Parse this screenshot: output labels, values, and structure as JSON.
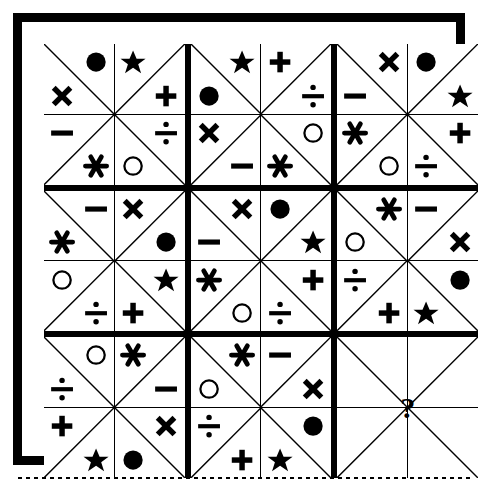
{
  "puzzle": {
    "title": "Symbol Matrix Logic Puzzle",
    "grid_size": "3x3 blocks",
    "block_size": "2x2 cells",
    "question_marker": "?",
    "colors": {
      "ink": "#000000",
      "paper": "#ffffff"
    },
    "symbol_legend": [
      {
        "key": "filled-circle",
        "name": "filled-circle-icon",
        "glyph": "●"
      },
      {
        "key": "open-circle",
        "name": "open-circle-icon",
        "glyph": "○"
      },
      {
        "key": "star",
        "name": "star-icon",
        "glyph": "★"
      },
      {
        "key": "cross",
        "name": "cross-icon",
        "glyph": "✕"
      },
      {
        "key": "plus",
        "name": "plus-icon",
        "glyph": "＋"
      },
      {
        "key": "minus",
        "name": "minus-icon",
        "glyph": "−"
      },
      {
        "key": "divide",
        "name": "divide-icon",
        "glyph": "÷"
      },
      {
        "key": "asterisk",
        "name": "asterisk-icon",
        "glyph": "✱"
      }
    ],
    "blocks": [
      {
        "index": 0,
        "position": "top-left",
        "is_question": false,
        "cells": [
          {
            "diagonal": "tl-br",
            "symbols": [
              {
                "slot": "ur",
                "key": "filled-circle"
              },
              {
                "slot": "ll",
                "key": "cross"
              }
            ]
          },
          {
            "diagonal": "tr-bl",
            "symbols": [
              {
                "slot": "ul",
                "key": "star"
              },
              {
                "slot": "lr",
                "key": "plus"
              }
            ]
          },
          {
            "diagonal": "tr-bl",
            "symbols": [
              {
                "slot": "ul",
                "key": "minus"
              },
              {
                "slot": "lr",
                "key": "asterisk"
              }
            ]
          },
          {
            "diagonal": "tl-br",
            "symbols": [
              {
                "slot": "ur",
                "key": "divide"
              },
              {
                "slot": "ll",
                "key": "open-circle"
              }
            ]
          }
        ]
      },
      {
        "index": 1,
        "position": "top-center",
        "is_question": false,
        "cells": [
          {
            "diagonal": "tl-br",
            "symbols": [
              {
                "slot": "ur",
                "key": "star"
              },
              {
                "slot": "ll",
                "key": "filled-circle"
              }
            ]
          },
          {
            "diagonal": "tr-bl",
            "symbols": [
              {
                "slot": "ul",
                "key": "plus"
              },
              {
                "slot": "lr",
                "key": "divide"
              }
            ]
          },
          {
            "diagonal": "tr-bl",
            "symbols": [
              {
                "slot": "ul",
                "key": "cross"
              },
              {
                "slot": "lr",
                "key": "minus"
              }
            ]
          },
          {
            "diagonal": "tl-br",
            "symbols": [
              {
                "slot": "ur",
                "key": "open-circle"
              },
              {
                "slot": "ll",
                "key": "asterisk"
              }
            ]
          }
        ]
      },
      {
        "index": 2,
        "position": "top-right",
        "is_question": false,
        "cells": [
          {
            "diagonal": "tl-br",
            "symbols": [
              {
                "slot": "ur",
                "key": "cross"
              },
              {
                "slot": "ll",
                "key": "minus"
              }
            ]
          },
          {
            "diagonal": "tr-bl",
            "symbols": [
              {
                "slot": "ul",
                "key": "filled-circle"
              },
              {
                "slot": "lr",
                "key": "star"
              }
            ]
          },
          {
            "diagonal": "tr-bl",
            "symbols": [
              {
                "slot": "ul",
                "key": "asterisk"
              },
              {
                "slot": "lr",
                "key": "open-circle"
              }
            ]
          },
          {
            "diagonal": "tl-br",
            "symbols": [
              {
                "slot": "ur",
                "key": "plus"
              },
              {
                "slot": "ll",
                "key": "divide"
              }
            ]
          }
        ]
      },
      {
        "index": 3,
        "position": "middle-left",
        "is_question": false,
        "cells": [
          {
            "diagonal": "tl-br",
            "symbols": [
              {
                "slot": "ur",
                "key": "minus"
              },
              {
                "slot": "ll",
                "key": "asterisk"
              }
            ]
          },
          {
            "diagonal": "tr-bl",
            "symbols": [
              {
                "slot": "ul",
                "key": "cross"
              },
              {
                "slot": "lr",
                "key": "filled-circle"
              }
            ]
          },
          {
            "diagonal": "tr-bl",
            "symbols": [
              {
                "slot": "ul",
                "key": "open-circle"
              },
              {
                "slot": "lr",
                "key": "divide"
              }
            ]
          },
          {
            "diagonal": "tl-br",
            "symbols": [
              {
                "slot": "ur",
                "key": "star"
              },
              {
                "slot": "ll",
                "key": "plus"
              }
            ]
          }
        ]
      },
      {
        "index": 4,
        "position": "middle-center",
        "is_question": false,
        "cells": [
          {
            "diagonal": "tl-br",
            "symbols": [
              {
                "slot": "ur",
                "key": "cross"
              },
              {
                "slot": "ll",
                "key": "minus"
              }
            ]
          },
          {
            "diagonal": "tr-bl",
            "symbols": [
              {
                "slot": "ul",
                "key": "filled-circle"
              },
              {
                "slot": "lr",
                "key": "star"
              }
            ]
          },
          {
            "diagonal": "tr-bl",
            "symbols": [
              {
                "slot": "ul",
                "key": "asterisk"
              },
              {
                "slot": "lr",
                "key": "open-circle"
              }
            ]
          },
          {
            "diagonal": "tl-br",
            "symbols": [
              {
                "slot": "ur",
                "key": "plus"
              },
              {
                "slot": "ll",
                "key": "divide"
              }
            ]
          }
        ]
      },
      {
        "index": 5,
        "position": "middle-right",
        "is_question": false,
        "cells": [
          {
            "diagonal": "tl-br",
            "symbols": [
              {
                "slot": "ur",
                "key": "asterisk"
              },
              {
                "slot": "ll",
                "key": "open-circle"
              }
            ]
          },
          {
            "diagonal": "tr-bl",
            "symbols": [
              {
                "slot": "ul",
                "key": "minus"
              },
              {
                "slot": "lr",
                "key": "cross"
              }
            ]
          },
          {
            "diagonal": "tr-bl",
            "symbols": [
              {
                "slot": "ul",
                "key": "divide"
              },
              {
                "slot": "lr",
                "key": "plus"
              }
            ]
          },
          {
            "diagonal": "tl-br",
            "symbols": [
              {
                "slot": "ur",
                "key": "filled-circle"
              },
              {
                "slot": "ll",
                "key": "star"
              }
            ]
          }
        ]
      },
      {
        "index": 6,
        "position": "bottom-left",
        "is_question": false,
        "cells": [
          {
            "diagonal": "tl-br",
            "symbols": [
              {
                "slot": "ur",
                "key": "open-circle"
              },
              {
                "slot": "ll",
                "key": "divide"
              }
            ]
          },
          {
            "diagonal": "tr-bl",
            "symbols": [
              {
                "slot": "ul",
                "key": "asterisk"
              },
              {
                "slot": "lr",
                "key": "minus"
              }
            ]
          },
          {
            "diagonal": "tr-bl",
            "symbols": [
              {
                "slot": "ul",
                "key": "plus"
              },
              {
                "slot": "lr",
                "key": "star"
              }
            ]
          },
          {
            "diagonal": "tl-br",
            "symbols": [
              {
                "slot": "ur",
                "key": "cross"
              },
              {
                "slot": "ll",
                "key": "filled-circle"
              }
            ]
          }
        ]
      },
      {
        "index": 7,
        "position": "bottom-center",
        "is_question": false,
        "cells": [
          {
            "diagonal": "tl-br",
            "symbols": [
              {
                "slot": "ur",
                "key": "asterisk"
              },
              {
                "slot": "ll",
                "key": "open-circle"
              }
            ]
          },
          {
            "diagonal": "tr-bl",
            "symbols": [
              {
                "slot": "ul",
                "key": "minus"
              },
              {
                "slot": "lr",
                "key": "cross"
              }
            ]
          },
          {
            "diagonal": "tr-bl",
            "symbols": [
              {
                "slot": "ul",
                "key": "divide"
              },
              {
                "slot": "lr",
                "key": "plus"
              }
            ]
          },
          {
            "diagonal": "tl-br",
            "symbols": [
              {
                "slot": "ur",
                "key": "filled-circle"
              },
              {
                "slot": "ll",
                "key": "star"
              }
            ]
          }
        ]
      },
      {
        "index": 8,
        "position": "bottom-right",
        "is_question": true,
        "cells": [
          {
            "diagonal": "tl-br",
            "symbols": []
          },
          {
            "diagonal": "tr-bl",
            "symbols": []
          },
          {
            "diagonal": "tr-bl",
            "symbols": []
          },
          {
            "diagonal": "tl-br",
            "symbols": []
          }
        ]
      }
    ]
  }
}
